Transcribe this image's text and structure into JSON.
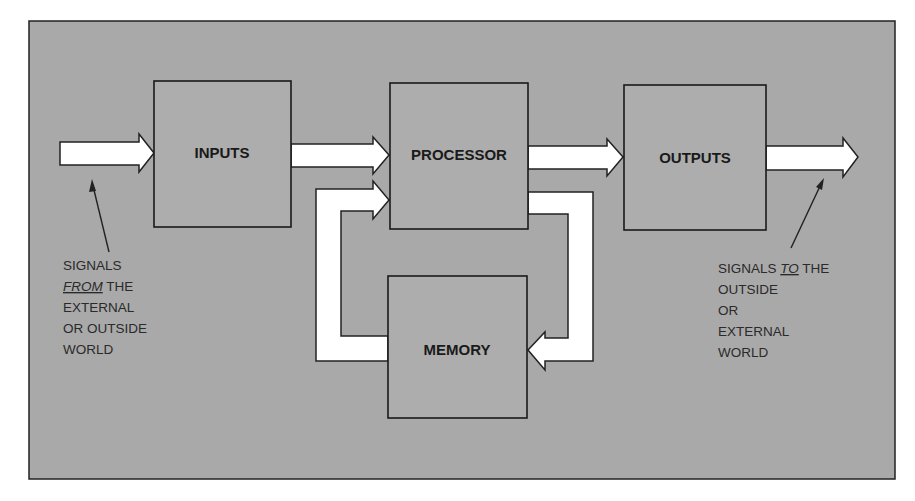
{
  "diagram": {
    "colors": {
      "frame_fill": "#a9a9a9",
      "block_fill": "#adadad",
      "arrow_fill": "#ffffff",
      "line": "#222222"
    },
    "blocks": {
      "inputs": {
        "label": "INPUTS"
      },
      "processor": {
        "label": "PROCESSOR"
      },
      "outputs": {
        "label": "OUTPUTS"
      },
      "memory": {
        "label": "MEMORY"
      }
    },
    "flows": [
      {
        "from": "external-world",
        "to": "inputs"
      },
      {
        "from": "inputs",
        "to": "processor"
      },
      {
        "from": "processor",
        "to": "outputs"
      },
      {
        "from": "outputs",
        "to": "external-world"
      },
      {
        "from": "processor",
        "to": "memory"
      },
      {
        "from": "memory",
        "to": "processor"
      }
    ],
    "annotations": {
      "left": {
        "line1": "SIGNALS",
        "line2_em": "FROM",
        "line2_rest": " THE",
        "line3": "EXTERNAL",
        "line4": "OR OUTSIDE",
        "line5": "WORLD"
      },
      "right": {
        "line1_pre": "SIGNALS ",
        "line1_em": "TO",
        "line1_post": " THE",
        "line2": "OUTSIDE",
        "line3": "OR",
        "line4": "EXTERNAL",
        "line5": "WORLD"
      }
    }
  }
}
